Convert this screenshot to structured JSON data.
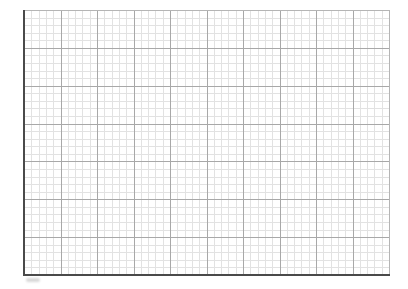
{
  "graph_paper": {
    "origin": {
      "x": 24,
      "y": 10
    },
    "width": 365,
    "height": 265,
    "major_columns": 10,
    "major_rows": 7,
    "minor_per_major": 5,
    "colors": {
      "background": "#ffffff",
      "minor_line": "#e2e2e2",
      "major_line": "#a8a8a8",
      "axis_line": "#4a4a4a",
      "border_line": "#b5b5b5"
    }
  },
  "corner_mark": ""
}
